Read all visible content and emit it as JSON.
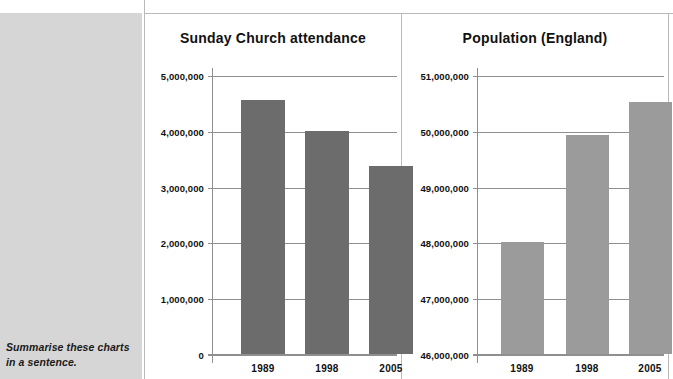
{
  "sidebar": {
    "prompt": "Summarise these charts in a sentence."
  },
  "chart_data": [
    {
      "type": "bar",
      "title": "Sunday Church attendance",
      "xlabel": "",
      "ylabel": "",
      "categories": [
        "1989",
        "1998",
        "2005"
      ],
      "values": [
        4550000,
        4000000,
        3370000
      ],
      "ylim": [
        0,
        5000000
      ],
      "ytick_labels": [
        "5,000,000",
        "4,000,000",
        "3,000,000",
        "2,000,000",
        "1,000,000",
        "0"
      ],
      "ytick_values": [
        5000000,
        4000000,
        3000000,
        2000000,
        1000000,
        0
      ],
      "grid": true,
      "legend": "none",
      "bar_color": "#6c6c6c"
    },
    {
      "type": "bar",
      "title": "Population (England)",
      "xlabel": "",
      "ylabel": "",
      "categories": [
        "1989",
        "1998",
        "2005"
      ],
      "values": [
        48000000,
        49930000,
        50520000
      ],
      "ylim": [
        46000000,
        51000000
      ],
      "ytick_labels": [
        "51,000,000",
        "50,000,000",
        "49,000,000",
        "48,000,000",
        "47,000,000",
        "46,000,000"
      ],
      "ytick_values": [
        51000000,
        50000000,
        49000000,
        48000000,
        47000000,
        46000000
      ],
      "grid": true,
      "legend": "none",
      "bar_color": "#9b9b9b"
    }
  ]
}
